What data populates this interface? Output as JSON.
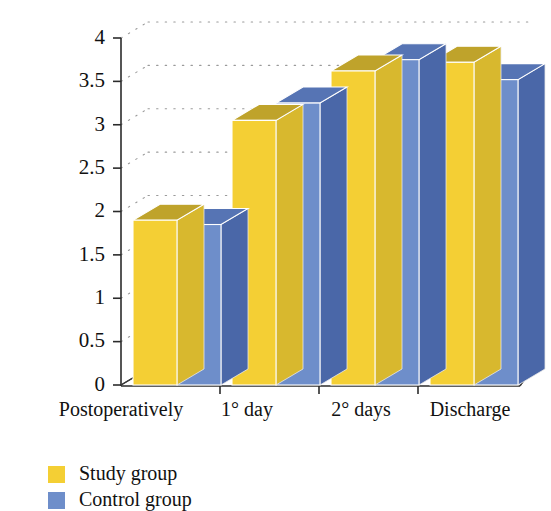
{
  "chart_data": {
    "type": "bar",
    "title": "",
    "subtitle": "",
    "xlabel": "",
    "ylabel": "",
    "categories": [
      "Postoperatively",
      "1° day",
      "2° days",
      "Discharge"
    ],
    "series": [
      {
        "name": "Study group",
        "color": "#F4CF34",
        "values": [
          1.9,
          3.05,
          3.62,
          3.72
        ]
      },
      {
        "name": "Control group",
        "color": "#6E8ECA",
        "values": [
          1.85,
          3.25,
          3.75,
          3.52
        ]
      }
    ],
    "ylim": [
      0,
      4
    ],
    "ytick_labels": [
      "0",
      "0.5",
      "1",
      "1.5",
      "2",
      "2.5",
      "3",
      "3.5",
      "4"
    ],
    "ytick_values": [
      0,
      0.5,
      1,
      1.5,
      2,
      2.5,
      3,
      3.5,
      4
    ],
    "grid": true,
    "grid_style": "dotted-horizontal",
    "legend_position": "bottom-left",
    "style": "3d-column",
    "legend": [
      {
        "label": "Study group",
        "color": "#F4CF34"
      },
      {
        "label": "Control group",
        "color": "#6E8ECA"
      }
    ]
  },
  "axes": {
    "y_ticks": [
      {
        "label": "0",
        "value": 0
      },
      {
        "label": "0.5",
        "value": 0.5
      },
      {
        "label": "1",
        "value": 1
      },
      {
        "label": "1.5",
        "value": 1.5
      },
      {
        "label": "2",
        "value": 2
      },
      {
        "label": "2.5",
        "value": 2.5
      },
      {
        "label": "3",
        "value": 3
      },
      {
        "label": "3.5",
        "value": 3.5
      },
      {
        "label": "4",
        "value": 4
      }
    ],
    "x_ticks": [
      {
        "label": "Postoperatively"
      },
      {
        "label": "1° day"
      },
      {
        "label": "2° days"
      },
      {
        "label": "Discharge"
      }
    ]
  },
  "colors": {
    "study_front": "#F4CF34",
    "study_top": "#BFA32B",
    "study_side": "#D8B82E",
    "control_front": "#6E8ECA",
    "control_top": "#5674B4",
    "control_side": "#4A67A8",
    "axis": "#2b2b2b",
    "grid": "#9a9a9a",
    "background": "#ffffff"
  }
}
